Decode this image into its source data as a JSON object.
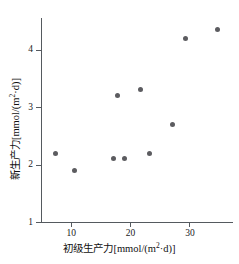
{
  "chart_data": {
    "type": "scatter",
    "title": "",
    "xlabel": "初级生产力[mmol/(m²·d)]",
    "ylabel": "新生产力[mmol/(m²·d)]",
    "xlabel_parts": {
      "name": "初级生产力",
      "open": "[mmol/(m",
      "sup": "2",
      "close": "·d)]"
    },
    "ylabel_parts": {
      "name": "新生产力",
      "open": "[mmol/(m",
      "sup": "2",
      "close": "·d)]"
    },
    "xlim": [
      5,
      37
    ],
    "ylim": [
      1,
      4.55
    ],
    "xticks": [
      10,
      20,
      30
    ],
    "yticks": [
      1,
      2,
      3,
      4
    ],
    "xtick_labels": [
      "10",
      "20",
      "30"
    ],
    "ytick_labels": [
      "1",
      "2",
      "3",
      "4"
    ],
    "grid": false,
    "legend": false,
    "marker_color": "#5c5c60",
    "axis_color": "#555a5f",
    "points": [
      {
        "x": 7.5,
        "y": 2.2
      },
      {
        "x": 10.6,
        "y": 1.9
      },
      {
        "x": 17.2,
        "y": 2.1
      },
      {
        "x": 17.9,
        "y": 3.2
      },
      {
        "x": 19.1,
        "y": 2.1
      },
      {
        "x": 21.7,
        "y": 3.3
      },
      {
        "x": 23.3,
        "y": 2.2
      },
      {
        "x": 27.1,
        "y": 2.7
      },
      {
        "x": 29.3,
        "y": 4.2
      },
      {
        "x": 34.8,
        "y": 4.35
      }
    ]
  }
}
